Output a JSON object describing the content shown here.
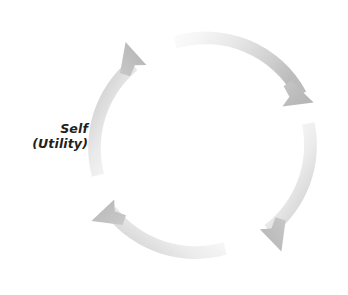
{
  "figure": {
    "name": "self-utility-cycle",
    "background_color": "#ffffff",
    "width": 348,
    "height": 295
  },
  "label": {
    "name": "self-utility-label",
    "line1": "Self",
    "line2": "(Utility)",
    "color": "#231f20",
    "style": "bold-italic"
  },
  "diagram": {
    "type": "cycle",
    "direction": "clockwise",
    "center_x": 203,
    "center_y": 146,
    "outer_radius": 114,
    "ring_thickness": 13,
    "segment_count": 4,
    "arrow_tail_color": "#fafafa",
    "arrow_head_color": "#b4b4b4",
    "segments": [
      {
        "name": "arrow-segment-top",
        "from_angle_deg": 255,
        "to_angle_deg": 340,
        "arrowhead_at": "top-right"
      },
      {
        "name": "arrow-segment-right",
        "from_angle_deg": 345,
        "to_angle_deg": 70,
        "arrowhead_at": "bottom-right"
      },
      {
        "name": "arrow-segment-bottom",
        "from_angle_deg": 75,
        "to_angle_deg": 160,
        "arrowhead_at": "bottom-left"
      },
      {
        "name": "arrow-segment-left",
        "from_angle_deg": 165,
        "to_angle_deg": 250,
        "arrowhead_at": "top-left"
      }
    ]
  }
}
